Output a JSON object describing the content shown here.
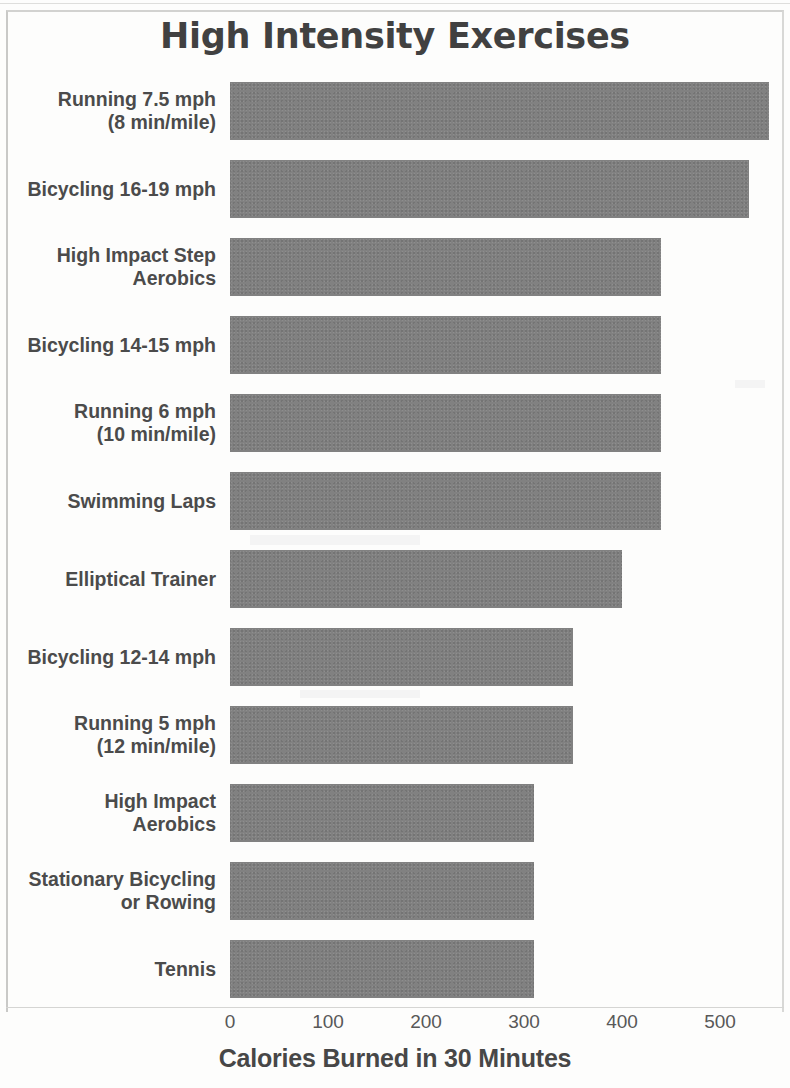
{
  "chart_data": {
    "type": "bar",
    "orientation": "horizontal",
    "title": "High Intensity Exercises",
    "xlabel": "Calories Burned in 30 Minutes",
    "ylabel": "",
    "xlim": [
      0,
      570
    ],
    "xticks": [
      0,
      100,
      200,
      300,
      400,
      500
    ],
    "xtick_labels": [
      "0",
      "100",
      "200",
      "300",
      "400",
      "500"
    ],
    "grid": false,
    "legend": null,
    "bar_color": "#818181",
    "categories": [
      "Running 7.5 mph\n(8 min/mile)",
      "Bicycling 16-19 mph",
      "High Impact Step\nAerobics",
      "Bicycling 14-15 mph",
      "Running 6 mph\n(10 min/mile)",
      "Swimming Laps",
      "Elliptical Trainer",
      "Bicycling 12-14 mph",
      "Running 5 mph\n(12 min/mile)",
      "High Impact\nAerobics",
      "Stationary Bicycling\nor Rowing",
      "Tennis"
    ],
    "values": [
      550,
      530,
      440,
      440,
      440,
      440,
      400,
      350,
      350,
      310,
      310,
      310
    ]
  },
  "axis": {
    "x_title": "Calories Burned in 30 Minutes",
    "ticks": [
      "0",
      "100",
      "200",
      "300",
      "400",
      "500"
    ]
  },
  "header": {
    "title": "High Intensity Exercises"
  },
  "rows": [
    {
      "label": "Running 7.5 mph\n(8 min/mile)",
      "value": 550
    },
    {
      "label": "Bicycling 16-19 mph",
      "value": 530
    },
    {
      "label": "High Impact Step\nAerobics",
      "value": 440
    },
    {
      "label": "Bicycling 14-15 mph",
      "value": 440
    },
    {
      "label": "Running 6 mph\n(10 min/mile)",
      "value": 440
    },
    {
      "label": "Swimming Laps",
      "value": 440
    },
    {
      "label": "Elliptical Trainer",
      "value": 400
    },
    {
      "label": "Bicycling 12-14 mph",
      "value": 350
    },
    {
      "label": "Running 5 mph\n(12 min/mile)",
      "value": 350
    },
    {
      "label": "High Impact\nAerobics",
      "value": 310
    },
    {
      "label": "Stationary Bicycling\nor Rowing",
      "value": 310
    },
    {
      "label": "Tennis",
      "value": 310
    }
  ]
}
